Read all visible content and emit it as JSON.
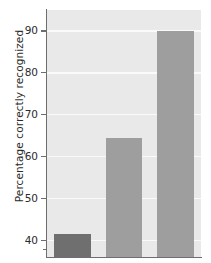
{
  "chart_data": {
    "type": "bar",
    "title": "",
    "xlabel": "",
    "ylabel": "Percentage correctly recognized",
    "categories": [
      "1",
      "2",
      "3"
    ],
    "values": [
      41.5,
      64.5,
      90.0
    ],
    "series": [
      {
        "name": "Percentage correctly recognized",
        "values": [
          41.5,
          64.5,
          90.0
        ]
      }
    ],
    "ylim": [
      36,
      95
    ],
    "yticks": [
      40,
      50,
      60,
      70,
      80,
      90
    ],
    "ytick_labels": [
      "40",
      "50",
      "60",
      "70",
      "80",
      "90"
    ],
    "xticks": [],
    "xtick_labels": [],
    "grid": "horizontal",
    "legend": "none",
    "bar_colors": [
      "#6f6f6f",
      "#9e9e9e",
      "#9e9e9e"
    ],
    "plot_background": "#e9e9e9",
    "gridline_color": "#fafafa",
    "axis_color": "#6e6e6e",
    "figure_background": "#ffffff"
  },
  "axis": {
    "y_title": "Percentage correctly recognized",
    "ticks": [
      {
        "label": "90",
        "value": 90
      },
      {
        "label": "80",
        "value": 80
      },
      {
        "label": "70",
        "value": 70
      },
      {
        "label": "60",
        "value": 60
      },
      {
        "label": "50",
        "value": 50
      },
      {
        "label": "40",
        "value": 40
      }
    ]
  },
  "bars": [
    {
      "name": "bar-1",
      "value": 41.5,
      "color": "#6f6f6f"
    },
    {
      "name": "bar-2",
      "value": 64.5,
      "color": "#9e9e9e"
    },
    {
      "name": "bar-3",
      "value": 90.0,
      "color": "#9e9e9e"
    }
  ]
}
